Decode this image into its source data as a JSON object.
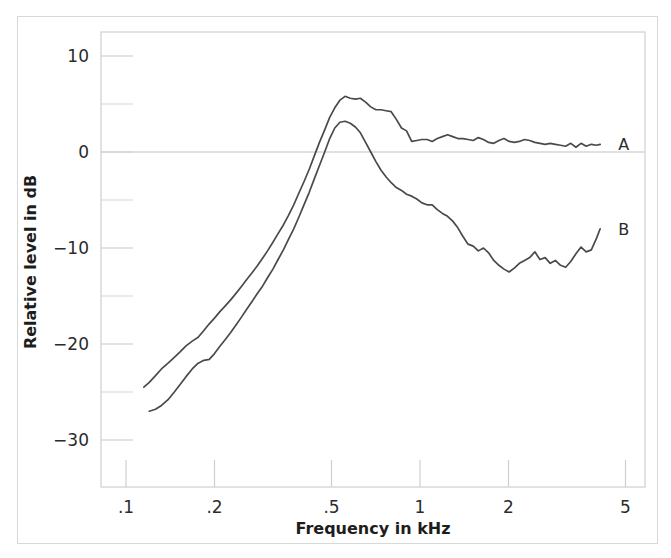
{
  "figure": {
    "background_color": "#ffffff",
    "frame_color": "#d8d8d8",
    "plot_frame_color": "#cfcfcf",
    "curve_color": "#4a4a4a",
    "text_color": "#2b2b2b"
  },
  "chart_data": {
    "type": "line",
    "title": "",
    "subtitle": "",
    "xlabel": "Frequency in kHz",
    "ylabel": "Relative level in dB",
    "xscale": "log",
    "yscale": "linear",
    "xlim": [
      0.085,
      5.8
    ],
    "ylim": [
      -34,
      13
    ],
    "grid": false,
    "zero_line": true,
    "legend_position": "right-inline",
    "x_ticks": [
      {
        "value": 0.1,
        "label": ".1"
      },
      {
        "value": 0.2,
        "label": ".2"
      },
      {
        "value": 0.5,
        "label": ".5"
      },
      {
        "value": 1,
        "label": "1"
      },
      {
        "value": 2,
        "label": "2"
      },
      {
        "value": 5,
        "label": "5"
      }
    ],
    "y_ticks_major": [
      {
        "value": 10,
        "label": "10"
      },
      {
        "value": 0,
        "label": "0"
      },
      {
        "value": -10,
        "label": "−10"
      },
      {
        "value": -20,
        "label": "−20"
      },
      {
        "value": -30,
        "label": "−30"
      }
    ],
    "y_ticks_minor": [
      5,
      -5,
      -15,
      -25
    ],
    "series": [
      {
        "name": "A",
        "label": "A",
        "color": "#4a4a4a",
        "x": [
          0.115,
          0.12,
          0.126,
          0.132,
          0.139,
          0.146,
          0.153,
          0.16,
          0.168,
          0.176,
          0.184,
          0.192,
          0.2,
          0.209,
          0.218,
          0.227,
          0.237,
          0.247,
          0.257,
          0.268,
          0.279,
          0.291,
          0.303,
          0.316,
          0.329,
          0.343,
          0.357,
          0.372,
          0.387,
          0.403,
          0.42,
          0.437,
          0.455,
          0.474,
          0.493,
          0.513,
          0.534,
          0.556,
          0.579,
          0.603,
          0.627,
          0.653,
          0.68,
          0.708,
          0.737,
          0.767,
          0.798,
          0.831,
          0.865,
          0.9,
          0.937,
          0.975,
          1.015,
          1.057,
          1.1,
          1.145,
          1.192,
          1.241,
          1.292,
          1.345,
          1.4,
          1.457,
          1.517,
          1.579,
          1.644,
          1.711,
          1.782,
          1.855,
          1.931,
          2.01,
          2.092,
          2.178,
          2.268,
          2.361,
          2.458,
          2.559,
          2.664,
          2.773,
          2.887,
          3.006,
          3.129,
          3.257,
          3.391,
          3.53,
          3.675,
          3.826,
          3.983,
          4.1
        ],
        "y": [
          -24.5,
          -24.0,
          -23.3,
          -22.6,
          -22.0,
          -21.4,
          -20.8,
          -20.2,
          -19.7,
          -19.3,
          -18.6,
          -17.9,
          -17.3,
          -16.6,
          -16.0,
          -15.4,
          -14.7,
          -14.0,
          -13.3,
          -12.6,
          -11.9,
          -11.1,
          -10.3,
          -9.4,
          -8.5,
          -7.6,
          -6.6,
          -5.5,
          -4.3,
          -3.1,
          -1.8,
          -0.4,
          1.0,
          2.3,
          3.6,
          4.6,
          5.4,
          5.8,
          5.6,
          5.5,
          5.6,
          5.2,
          4.7,
          4.4,
          4.4,
          4.3,
          4.2,
          3.4,
          2.5,
          2.2,
          1.1,
          1.2,
          1.3,
          1.3,
          1.1,
          1.4,
          1.6,
          1.8,
          1.6,
          1.4,
          1.4,
          1.3,
          1.2,
          1.5,
          1.3,
          1.0,
          0.9,
          1.2,
          1.4,
          1.1,
          1.0,
          1.1,
          1.3,
          1.2,
          1.0,
          0.9,
          0.8,
          0.9,
          0.8,
          0.7,
          0.6,
          0.9,
          0.5,
          0.9,
          0.6,
          0.8,
          0.7,
          0.8
        ]
      },
      {
        "name": "B",
        "label": "B",
        "color": "#4a4a4a",
        "x": [
          0.12,
          0.126,
          0.132,
          0.139,
          0.146,
          0.153,
          0.16,
          0.168,
          0.176,
          0.184,
          0.192,
          0.2,
          0.209,
          0.218,
          0.227,
          0.237,
          0.247,
          0.257,
          0.268,
          0.279,
          0.291,
          0.303,
          0.316,
          0.329,
          0.343,
          0.357,
          0.372,
          0.387,
          0.403,
          0.42,
          0.437,
          0.455,
          0.474,
          0.493,
          0.513,
          0.534,
          0.556,
          0.579,
          0.603,
          0.627,
          0.653,
          0.68,
          0.708,
          0.737,
          0.767,
          0.798,
          0.831,
          0.865,
          0.9,
          0.937,
          0.975,
          1.015,
          1.057,
          1.1,
          1.145,
          1.192,
          1.241,
          1.292,
          1.345,
          1.4,
          1.457,
          1.517,
          1.579,
          1.644,
          1.711,
          1.782,
          1.855,
          1.931,
          2.01,
          2.092,
          2.178,
          2.268,
          2.361,
          2.458,
          2.559,
          2.664,
          2.773,
          2.887,
          3.006,
          3.129,
          3.257,
          3.391,
          3.53,
          3.675,
          3.826,
          3.983,
          4.1
        ],
        "y": [
          -27.0,
          -26.8,
          -26.4,
          -25.8,
          -25.0,
          -24.2,
          -23.4,
          -22.6,
          -22.0,
          -21.7,
          -21.6,
          -21.0,
          -20.2,
          -19.5,
          -18.8,
          -18.0,
          -17.2,
          -16.4,
          -15.6,
          -14.8,
          -14.0,
          -13.1,
          -12.2,
          -11.2,
          -10.2,
          -9.1,
          -8.0,
          -6.8,
          -5.5,
          -4.2,
          -2.8,
          -1.4,
          0.0,
          1.4,
          2.5,
          3.1,
          3.2,
          3.0,
          2.6,
          2.0,
          1.0,
          0.0,
          -1.0,
          -1.9,
          -2.6,
          -3.2,
          -3.7,
          -4.0,
          -4.4,
          -4.6,
          -4.9,
          -5.3,
          -5.5,
          -5.5,
          -6.0,
          -6.4,
          -6.7,
          -7.2,
          -7.9,
          -8.8,
          -9.6,
          -9.8,
          -10.3,
          -10.0,
          -10.5,
          -11.3,
          -11.8,
          -12.2,
          -12.5,
          -12.1,
          -11.6,
          -11.3,
          -11.0,
          -10.4,
          -11.2,
          -11.0,
          -11.6,
          -11.3,
          -11.8,
          -12.0,
          -11.4,
          -10.6,
          -9.9,
          -10.4,
          -10.2,
          -9.0,
          -8.0
        ]
      }
    ]
  }
}
